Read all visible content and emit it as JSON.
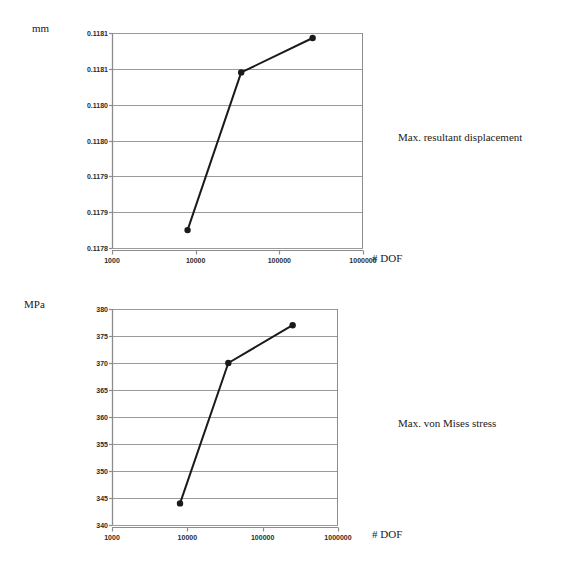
{
  "figures": [
    {
      "id": "displacement",
      "unit_label": "mm",
      "caption": "Max. resultant displacement",
      "xaxis_title": "# DOF"
    },
    {
      "id": "stress",
      "unit_label": "MPa",
      "caption": "Max. von Mises stress",
      "xaxis_title": "# DOF"
    }
  ],
  "chart_data": [
    {
      "type": "line",
      "title": "Max. resultant displacement",
      "xlabel": "# DOF",
      "ylabel": "mm",
      "xscale": "log",
      "xlim": [
        1000,
        1000000
      ],
      "ylim": [
        0.11783,
        0.11813
      ],
      "grid": true,
      "legend": "none",
      "xticks": [
        1000,
        10000,
        100000,
        1000000
      ],
      "xticklabels": [
        "1000",
        "10000",
        "100000",
        "1000000"
      ],
      "yticks": [
        0.11813,
        0.11808,
        0.11803,
        0.11798,
        0.11793,
        0.11788,
        0.11783
      ],
      "yticklabels": [
        "0.1181",
        "0.1181",
        "0.1180",
        "0.1180",
        "0.1179",
        "0.1179",
        "0.1178"
      ],
      "series": [
        {
          "name": "Max. resultant displacement",
          "marker": "filled-circle",
          "x": [
            8000,
            35000,
            250000
          ],
          "y": [
            0.117855,
            0.118075,
            0.118123
          ]
        }
      ]
    },
    {
      "type": "line",
      "title": "Max. von Mises stress",
      "xlabel": "# DOF",
      "ylabel": "MPa",
      "xscale": "log",
      "xlim": [
        1000,
        1000000
      ],
      "ylim": [
        340,
        380
      ],
      "grid": true,
      "legend": "none",
      "xticks": [
        1000,
        10000,
        100000,
        1000000
      ],
      "xticklabels": [
        "1000",
        "10000",
        "100000",
        "1000000"
      ],
      "yticks": [
        380,
        375,
        370,
        365,
        360,
        355,
        350,
        345,
        340
      ],
      "yticklabels": [
        "380",
        "375",
        "370",
        "365",
        "360",
        "355",
        "350",
        "345",
        "340"
      ],
      "series": [
        {
          "name": "Max. von Mises stress",
          "marker": "filled-circle",
          "x": [
            8000,
            35000,
            250000
          ],
          "y": [
            344,
            370,
            377
          ]
        }
      ]
    }
  ],
  "style": {
    "line_color": "#1a1a1a",
    "grid_color": "#9a9a9a",
    "axis_color": "#8c8c8c",
    "text_color": "#1a1a1a",
    "background": "#ffffff"
  }
}
